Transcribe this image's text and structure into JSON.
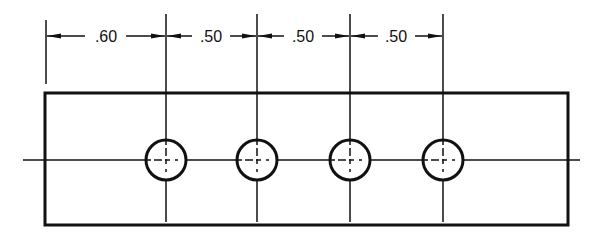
{
  "diagram": {
    "type": "engineering-drawing",
    "line_color": "#111111",
    "background": "#ffffff",
    "dimensions": [
      {
        "label": ".60",
        "from": "left edge",
        "to": "hole 1 center"
      },
      {
        "label": ".50",
        "from": "hole 1 center",
        "to": "hole 2 center"
      },
      {
        "label": ".50",
        "from": "hole 2 center",
        "to": "hole 3 center"
      },
      {
        "label": ".50",
        "from": "hole 3 center",
        "to": "hole 4 center"
      }
    ],
    "holes": [
      {
        "id": "hole-1"
      },
      {
        "id": "hole-2"
      },
      {
        "id": "hole-3"
      },
      {
        "id": "hole-4"
      }
    ]
  }
}
